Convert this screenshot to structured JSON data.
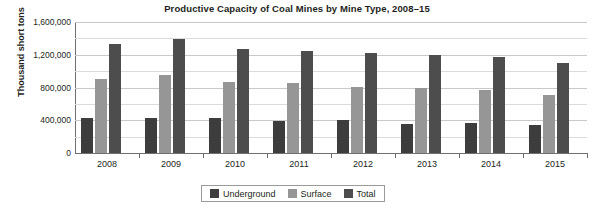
{
  "chart_data": {
    "type": "bar",
    "title": "Productive Capacity of Coal Mines by Mine Type, 2008–15",
    "xlabel": "",
    "ylabel": "Thousand short tons",
    "categories": [
      "2008",
      "2009",
      "2010",
      "2011",
      "2012",
      "2013",
      "2014",
      "2015"
    ],
    "series": [
      {
        "name": "Underground",
        "color": "#3d3d3d",
        "values": [
          430000,
          430000,
          425000,
          390000,
          400000,
          360000,
          365000,
          345000
        ]
      },
      {
        "name": "Surface",
        "color": "#969696",
        "values": [
          900000,
          950000,
          865000,
          860000,
          810000,
          800000,
          770000,
          705000
        ]
      },
      {
        "name": "Total",
        "color": "#4d4d4d",
        "values": [
          1330000,
          1390000,
          1270000,
          1250000,
          1220000,
          1195000,
          1175000,
          1095000
        ]
      }
    ],
    "ylim": [
      0,
      1600000
    ],
    "ytick_labels": [
      "1,600,000",
      "1,200,000",
      "800,000",
      "400,000",
      "0"
    ],
    "ytick_values": [
      1600000,
      1200000,
      800000,
      400000,
      0
    ],
    "minor_gridline_values": [
      1400000,
      1000000,
      600000,
      200000
    ],
    "grid": true,
    "legend_position": "bottom-center",
    "legend_entries": [
      "Underground",
      "Surface",
      "Total"
    ]
  }
}
